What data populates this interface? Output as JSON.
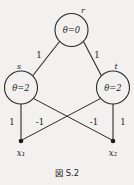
{
  "figure": {
    "caption": "図 S.2",
    "background_color": "#f2f1ef",
    "ink_color": "#1d1c1a"
  },
  "graph": {
    "nodes": [
      {
        "id": "r",
        "name": "r",
        "value": "θ=0",
        "cx": 71.5,
        "cy": 30,
        "r": 16.5,
        "name_x": 83,
        "name_y": 13
      },
      {
        "id": "s",
        "name": "s",
        "value": "θ=2",
        "cx": 21,
        "cy": 87.5,
        "r": 16.5,
        "name_x": 19,
        "name_y": 69
      },
      {
        "id": "t",
        "name": "t",
        "value": "θ=2",
        "cx": 113,
        "cy": 87.5,
        "r": 16.5,
        "name_x": 116,
        "name_y": 69
      }
    ],
    "terminals": [
      {
        "id": "x1",
        "name": "x₁",
        "cx": 21,
        "cy": 141,
        "label_x": 21,
        "label_y": 156
      },
      {
        "id": "x2",
        "name": "x₂",
        "cx": 113,
        "cy": 141,
        "label_x": 113,
        "label_y": 156
      }
    ],
    "edges": [
      {
        "from": "r",
        "to": "s",
        "weight": "1",
        "x1": 59.5,
        "y1": 41.5,
        "x2": 32.5,
        "y2": 76,
        "label_x": 39,
        "label_y": 58
      },
      {
        "from": "r",
        "to": "t",
        "weight": "1",
        "x1": 83.5,
        "y1": 41.5,
        "x2": 101.5,
        "y2": 76,
        "label_x": 97,
        "label_y": 58
      },
      {
        "from": "s",
        "to": "x1",
        "weight": "1",
        "x1": 21,
        "y1": 104,
        "x2": 21,
        "y2": 141,
        "label_x": 12,
        "label_y": 125
      },
      {
        "from": "s",
        "to": "x2",
        "weight": "-1",
        "x1": 33.5,
        "y1": 98.5,
        "x2": 112,
        "y2": 140,
        "label_x": 40,
        "label_y": 125
      },
      {
        "from": "t",
        "to": "x1",
        "weight": "-1",
        "x1": 100.5,
        "y1": 98.5,
        "x2": 22,
        "y2": 140,
        "label_x": 94,
        "label_y": 125
      },
      {
        "from": "t",
        "to": "x2",
        "weight": "1",
        "x1": 113,
        "y1": 104,
        "x2": 113,
        "y2": 141,
        "label_x": 123,
        "label_y": 125
      }
    ]
  }
}
